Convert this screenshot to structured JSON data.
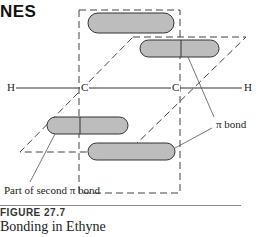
{
  "header": {
    "title_fragment": "NES"
  },
  "diagram": {
    "atoms": {
      "h_left": "H",
      "c_left": "C",
      "c_right": "C",
      "h_right": "H"
    },
    "labels": {
      "pi_bond": "π bond",
      "second_pi_bond": "Part of second π bond"
    },
    "colors": {
      "orbital_fill": "#bdbdbd",
      "orbital_stroke": "#333333",
      "dash": "#444444"
    }
  },
  "caption": {
    "figure_number": "FIGURE 27.7",
    "title": "Bonding in Ethyne"
  }
}
